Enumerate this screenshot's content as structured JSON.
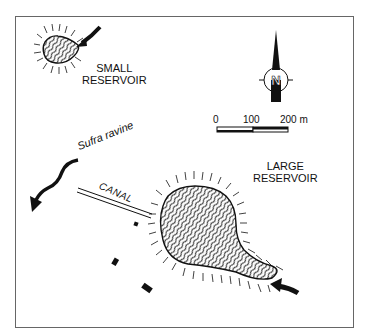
{
  "map": {
    "labels": {
      "small_reservoir_line1": "SMALL",
      "small_reservoir_line2": "RESERVOIR",
      "large_reservoir_line1": "LARGE",
      "large_reservoir_line2": "RESERVOIR",
      "ravine": "Sufra ravine",
      "canal": "CANAL",
      "north": "N"
    },
    "scale_bar": {
      "tick_0": "0",
      "tick_100": "100",
      "tick_200": "200 m"
    },
    "icons": [
      "north-arrow-icon",
      "inflow-arrow-icon",
      "outflow-arrow-icon"
    ],
    "colors": {
      "ink": "#111111",
      "frame": "#666666",
      "background": "#ffffff"
    }
  }
}
